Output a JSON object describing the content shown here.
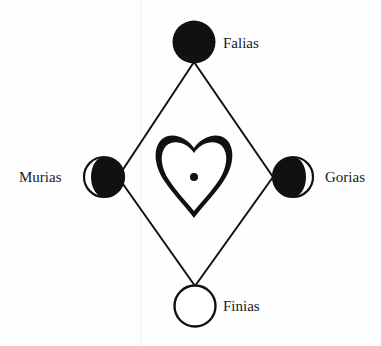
{
  "diagram": {
    "colors": {
      "ink": "#111111",
      "paper": "#fefefe"
    },
    "nodes": [
      {
        "id": "falias",
        "label": "Falias",
        "position": "top",
        "symbol": "full-dark-circle",
        "cx": 194,
        "cy": 42,
        "r": 21
      },
      {
        "id": "murias",
        "label": "Murias",
        "position": "left",
        "symbol": "crescent-dark-right",
        "cx": 104,
        "cy": 177,
        "r": 20
      },
      {
        "id": "gorias",
        "label": "Gorias",
        "position": "right",
        "symbol": "crescent-dark-left",
        "cx": 293,
        "cy": 177,
        "r": 20
      },
      {
        "id": "finias",
        "label": "Finias",
        "position": "bottom",
        "symbol": "empty-circle",
        "cx": 195,
        "cy": 306,
        "r": 21
      }
    ],
    "center": {
      "symbol": "heart-with-dot",
      "description": "heart outline with a central dot"
    },
    "edges": [
      [
        "falias",
        "murias"
      ],
      [
        "falias",
        "gorias"
      ],
      [
        "murias",
        "finias"
      ],
      [
        "gorias",
        "finias"
      ]
    ]
  }
}
